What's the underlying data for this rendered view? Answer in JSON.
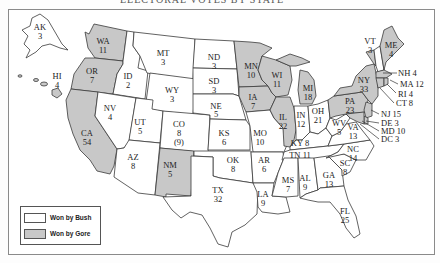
{
  "title": "ELECTORAL VOTES BY STATE",
  "legend": {
    "bush": {
      "label": "Won by Bush",
      "color": "#ffffff"
    },
    "gore": {
      "label": "Won by Gore",
      "color": "#c8c8c8"
    }
  },
  "states": {
    "AK": {
      "abbr": "AK",
      "votes": "3",
      "winner": "Bush"
    },
    "HI": {
      "abbr": "HI",
      "votes": "4",
      "winner": "Gore"
    },
    "WA": {
      "abbr": "WA",
      "votes": "11",
      "winner": "Gore"
    },
    "OR": {
      "abbr": "OR",
      "votes": "7",
      "winner": "Gore"
    },
    "CA": {
      "abbr": "CA",
      "votes": "54",
      "winner": "Gore"
    },
    "ID": {
      "abbr": "ID",
      "votes": "2",
      "winner": "Bush"
    },
    "NV": {
      "abbr": "NV",
      "votes": "4",
      "winner": "Bush"
    },
    "MT": {
      "abbr": "MT",
      "votes": "3",
      "winner": "Bush"
    },
    "WY": {
      "abbr": "WY",
      "votes": "3",
      "winner": "Bush"
    },
    "UT": {
      "abbr": "UT",
      "votes": "5",
      "winner": "Bush"
    },
    "AZ": {
      "abbr": "AZ",
      "votes": "8",
      "winner": "Bush"
    },
    "CO": {
      "abbr": "CO",
      "votes": "8",
      "note": "(9)",
      "winner": "Bush"
    },
    "NM": {
      "abbr": "NM",
      "votes": "5",
      "winner": "Gore"
    },
    "ND": {
      "abbr": "ND",
      "votes": "3",
      "winner": "Bush"
    },
    "SD": {
      "abbr": "SD",
      "votes": "3",
      "winner": "Bush"
    },
    "NE": {
      "abbr": "NE",
      "votes": "5",
      "winner": "Bush"
    },
    "KS": {
      "abbr": "KS",
      "votes": "6",
      "winner": "Bush"
    },
    "OK": {
      "abbr": "OK",
      "votes": "8",
      "winner": "Bush"
    },
    "TX": {
      "abbr": "TX",
      "votes": "32",
      "winner": "Bush"
    },
    "MN": {
      "abbr": "MN",
      "votes": "10",
      "winner": "Gore"
    },
    "IA": {
      "abbr": "IA",
      "votes": "7",
      "winner": "Gore"
    },
    "MO": {
      "abbr": "MO",
      "votes": "10",
      "winner": "Bush"
    },
    "AR": {
      "abbr": "AR",
      "votes": "6",
      "winner": "Bush"
    },
    "LA": {
      "abbr": "LA",
      "votes": "9",
      "winner": "Bush"
    },
    "WI": {
      "abbr": "WI",
      "votes": "11",
      "winner": "Gore"
    },
    "IL": {
      "abbr": "IL",
      "votes": "22",
      "winner": "Gore"
    },
    "MS": {
      "abbr": "MS",
      "votes": "7",
      "winner": "Bush"
    },
    "MI": {
      "abbr": "MI",
      "votes": "18",
      "winner": "Gore"
    },
    "IN": {
      "abbr": "IN",
      "votes": "12",
      "winner": "Bush"
    },
    "OH": {
      "abbr": "OH",
      "votes": "21",
      "winner": "Bush"
    },
    "KY": {
      "abbr": "KY",
      "votes": "8",
      "winner": "Bush"
    },
    "TN": {
      "abbr": "TN",
      "votes": "11",
      "winner": "Bush"
    },
    "AL": {
      "abbr": "AL",
      "votes": "9",
      "winner": "Bush"
    },
    "GA": {
      "abbr": "GA",
      "votes": "13",
      "winner": "Bush"
    },
    "FL": {
      "abbr": "FL",
      "votes": "25",
      "winner": "Bush"
    },
    "SC": {
      "abbr": "SC",
      "votes": "8",
      "winner": "Bush"
    },
    "NC": {
      "abbr": "NC",
      "votes": "14",
      "winner": "Bush"
    },
    "VA": {
      "abbr": "VA",
      "votes": "13",
      "winner": "Bush"
    },
    "WV": {
      "abbr": "WV",
      "votes": "5",
      "winner": "Bush"
    },
    "PA": {
      "abbr": "PA",
      "votes": "23",
      "winner": "Gore"
    },
    "NY": {
      "abbr": "NY",
      "votes": "33",
      "winner": "Gore"
    },
    "VT": {
      "abbr": "VT",
      "votes": "3",
      "winner": "Gore"
    },
    "ME": {
      "abbr": "ME",
      "votes": "4",
      "winner": "Gore"
    },
    "NH": {
      "abbr": "NH",
      "votes": "4",
      "label": "NH 4",
      "winner": "Bush"
    },
    "MA": {
      "abbr": "MA",
      "votes": "12",
      "label": "MA 12",
      "winner": "Gore"
    },
    "RI": {
      "abbr": "RI",
      "votes": "4",
      "label": "RI 4",
      "winner": "Gore"
    },
    "CT": {
      "abbr": "CT",
      "votes": "8",
      "label": "CT 8",
      "winner": "Gore"
    },
    "NJ": {
      "abbr": "NJ",
      "votes": "15",
      "label": "NJ 15",
      "winner": "Gore"
    },
    "DE": {
      "abbr": "DE",
      "votes": "3",
      "label": "DE 3",
      "winner": "Gore"
    },
    "MD": {
      "abbr": "MD",
      "votes": "10",
      "label": "MD 10",
      "winner": "Gore"
    },
    "DC": {
      "abbr": "DC",
      "votes": "3",
      "label": "DC 3",
      "winner": "Gore"
    }
  }
}
